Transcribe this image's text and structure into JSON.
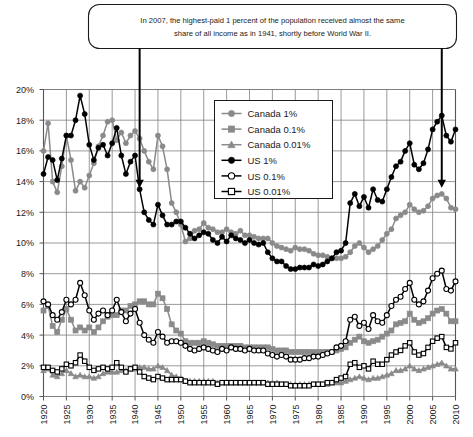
{
  "annotation": {
    "line1": "In 2007, the highest-paid 1 percent of the population received almost the same",
    "line2": "share of all income as in 1941, shortly before World War II.",
    "arrow_left_year": 1941,
    "arrow_right_year": 2007
  },
  "legend": {
    "position": "top-center-inside",
    "items": [
      {
        "label": "Canada 1%",
        "key": "canada_1",
        "color": "#8a8a8a",
        "marker": "circle-filled"
      },
      {
        "label": "Canada 0.1%",
        "key": "canada_01",
        "color": "#8a8a8a",
        "marker": "square-filled"
      },
      {
        "label": "Canada 0.01%",
        "key": "canada_001",
        "color": "#8a8a8a",
        "marker": "triangle-filled"
      },
      {
        "label": "US 1%",
        "key": "us_1",
        "color": "#000000",
        "marker": "circle-filled"
      },
      {
        "label": "US 0.1%",
        "key": "us_01",
        "color": "#000000",
        "marker": "circle-open"
      },
      {
        "label": "US 0.01%",
        "key": "us_001",
        "color": "#000000",
        "marker": "square-open"
      }
    ]
  },
  "chart_data": {
    "type": "line",
    "title": "",
    "xlabel": "",
    "ylabel": "",
    "xlim": [
      1920,
      2010
    ],
    "ylim": [
      0,
      20
    ],
    "ytick_values": [
      0,
      2,
      4,
      6,
      8,
      10,
      12,
      14,
      16,
      18,
      20
    ],
    "ytick_labels": [
      "0%",
      "2%",
      "4%",
      "6%",
      "8%",
      "10%",
      "12%",
      "14%",
      "16%",
      "18%",
      "20%"
    ],
    "xtick_values": [
      1920,
      1925,
      1930,
      1935,
      1940,
      1945,
      1950,
      1955,
      1960,
      1965,
      1970,
      1975,
      1980,
      1985,
      1990,
      1995,
      2000,
      2005,
      2010
    ],
    "xtick_labels": [
      "1920",
      "1925",
      "1930",
      "1935",
      "1940",
      "1945",
      "1950",
      "1955",
      "1960",
      "1965",
      "1970",
      "1975",
      "1980",
      "1985",
      "1990",
      "1995",
      "2000",
      "2005",
      "2010"
    ],
    "grid": true,
    "x": [
      1920,
      1921,
      1922,
      1923,
      1924,
      1925,
      1926,
      1927,
      1928,
      1929,
      1930,
      1931,
      1932,
      1933,
      1934,
      1935,
      1936,
      1937,
      1938,
      1939,
      1940,
      1941,
      1942,
      1943,
      1944,
      1945,
      1946,
      1947,
      1948,
      1949,
      1950,
      1951,
      1952,
      1953,
      1954,
      1955,
      1956,
      1957,
      1958,
      1959,
      1960,
      1961,
      1962,
      1963,
      1964,
      1965,
      1966,
      1967,
      1968,
      1969,
      1970,
      1971,
      1972,
      1973,
      1974,
      1975,
      1976,
      1977,
      1978,
      1979,
      1980,
      1981,
      1982,
      1983,
      1984,
      1985,
      1986,
      1987,
      1988,
      1989,
      1990,
      1991,
      1992,
      1993,
      1994,
      1995,
      1996,
      1997,
      1998,
      1999,
      2000,
      2001,
      2002,
      2003,
      2004,
      2005,
      2006,
      2007,
      2008,
      2009,
      2010
    ],
    "series": [
      {
        "name": "Canada 1%",
        "key": "canada_1",
        "color": "#8a8a8a",
        "marker": "circle-filled",
        "values": [
          16.0,
          17.8,
          14.0,
          13.3,
          15.0,
          17.0,
          15.4,
          13.4,
          14.0,
          13.6,
          14.4,
          15.2,
          16.3,
          17.0,
          17.9,
          18.0,
          16.7,
          17.2,
          16.5,
          17.0,
          17.3,
          16.8,
          16.0,
          15.3,
          14.8,
          17.0,
          16.3,
          14.8,
          12.6,
          12.0,
          11.2,
          10.1,
          10.3,
          10.8,
          10.9,
          11.3,
          11.0,
          10.9,
          10.7,
          10.7,
          10.9,
          10.7,
          10.6,
          10.8,
          10.5,
          10.5,
          10.4,
          10.3,
          10.3,
          10.3,
          10.0,
          9.8,
          9.7,
          9.6,
          9.5,
          9.7,
          9.6,
          9.6,
          9.5,
          9.3,
          9.2,
          9.2,
          9.1,
          9.0,
          9.0,
          9.0,
          9.1,
          9.4,
          9.8,
          10.0,
          9.7,
          9.4,
          9.6,
          9.8,
          10.2,
          10.6,
          10.9,
          11.6,
          11.8,
          12.0,
          12.5,
          12.2,
          12.0,
          12.1,
          12.4,
          12.9,
          13.1,
          13.2,
          12.9,
          12.3,
          12.2
        ]
      },
      {
        "name": "Canada 0.1%",
        "key": "canada_01",
        "color": "#8a8a8a",
        "marker": "square-filled",
        "values": [
          5.6,
          5.9,
          4.6,
          4.2,
          5.0,
          5.7,
          5.0,
          4.3,
          4.5,
          4.3,
          4.5,
          4.2,
          4.5,
          4.9,
          5.2,
          5.3,
          5.3,
          5.6,
          5.6,
          5.9,
          6.0,
          6.2,
          6.2,
          6.0,
          6.0,
          6.7,
          6.4,
          5.7,
          4.7,
          4.3,
          4.1,
          3.6,
          3.5,
          3.5,
          3.5,
          3.6,
          3.5,
          3.4,
          3.3,
          3.3,
          3.3,
          3.3,
          3.3,
          3.3,
          3.2,
          3.2,
          3.2,
          3.2,
          3.2,
          3.2,
          3.1,
          3.0,
          3.0,
          3.0,
          2.9,
          2.9,
          2.9,
          2.9,
          2.9,
          2.9,
          2.9,
          2.9,
          2.9,
          2.9,
          3.0,
          3.1,
          3.2,
          3.5,
          3.7,
          3.9,
          3.6,
          3.5,
          3.6,
          3.7,
          3.9,
          4.1,
          4.3,
          4.7,
          4.8,
          4.9,
          5.4,
          5.0,
          4.8,
          4.9,
          5.1,
          5.4,
          5.6,
          5.7,
          5.4,
          4.9,
          4.9
        ]
      },
      {
        "name": "Canada 0.01%",
        "key": "canada_001",
        "color": "#8a8a8a",
        "marker": "triangle-filled",
        "values": [
          1.7,
          1.8,
          1.4,
          1.3,
          1.5,
          1.7,
          1.5,
          1.3,
          1.4,
          1.3,
          1.3,
          1.2,
          1.3,
          1.5,
          1.6,
          1.6,
          1.6,
          1.7,
          1.7,
          1.8,
          1.8,
          1.9,
          1.9,
          1.8,
          1.8,
          2.0,
          1.9,
          1.7,
          1.4,
          1.3,
          1.2,
          1.0,
          1.0,
          1.0,
          1.0,
          1.0,
          1.0,
          1.0,
          0.9,
          0.9,
          0.9,
          0.9,
          0.9,
          0.9,
          0.9,
          0.9,
          0.9,
          0.9,
          0.9,
          0.9,
          0.9,
          0.9,
          0.8,
          0.8,
          0.8,
          0.8,
          0.8,
          0.8,
          0.8,
          0.8,
          0.8,
          0.8,
          0.8,
          0.9,
          0.9,
          0.9,
          1.0,
          1.1,
          1.2,
          1.3,
          1.2,
          1.1,
          1.2,
          1.2,
          1.3,
          1.4,
          1.5,
          1.7,
          1.7,
          1.8,
          2.0,
          1.8,
          1.7,
          1.8,
          1.9,
          2.0,
          2.1,
          2.2,
          2.0,
          1.8,
          1.8
        ]
      },
      {
        "name": "US 1%",
        "key": "us_1",
        "color": "#000000",
        "marker": "circle-filled",
        "values": [
          14.5,
          15.6,
          15.4,
          14.1,
          15.5,
          17.0,
          17.0,
          18.0,
          19.6,
          18.4,
          16.4,
          15.4,
          16.2,
          16.4,
          15.7,
          16.5,
          17.5,
          15.7,
          14.5,
          15.3,
          15.7,
          13.5,
          12.0,
          11.5,
          11.2,
          12.5,
          11.8,
          11.2,
          11.2,
          11.4,
          11.4,
          11.0,
          10.6,
          10.3,
          10.5,
          10.7,
          10.6,
          10.2,
          10.0,
          10.4,
          10.1,
          10.5,
          10.3,
          10.2,
          10.0,
          10.2,
          10.0,
          9.9,
          10.0,
          9.4,
          9.0,
          8.8,
          8.8,
          8.5,
          8.3,
          8.3,
          8.4,
          8.4,
          8.4,
          8.6,
          8.5,
          8.6,
          8.8,
          9.0,
          9.4,
          9.5,
          10.0,
          12.6,
          13.2,
          12.4,
          13.0,
          12.3,
          13.5,
          12.8,
          12.7,
          13.5,
          14.3,
          15.0,
          15.3,
          16.0,
          16.5,
          15.1,
          14.8,
          15.2,
          16.1,
          17.4,
          17.9,
          18.3,
          17.0,
          16.6,
          17.4
        ]
      },
      {
        "name": "US 0.1%",
        "key": "us_01",
        "color": "#000000",
        "marker": "circle-open",
        "values": [
          6.2,
          6.0,
          5.3,
          5.0,
          5.5,
          6.3,
          6.0,
          6.3,
          7.4,
          6.6,
          5.6,
          5.0,
          5.4,
          5.6,
          5.3,
          5.6,
          6.3,
          5.5,
          4.9,
          5.4,
          5.7,
          4.8,
          4.0,
          3.7,
          3.5,
          4.2,
          3.9,
          3.5,
          3.6,
          3.6,
          3.5,
          3.3,
          3.1,
          3.0,
          3.1,
          3.2,
          3.1,
          3.0,
          2.9,
          3.1,
          3.0,
          3.2,
          3.1,
          3.1,
          3.0,
          3.1,
          3.0,
          3.0,
          3.0,
          2.8,
          2.7,
          2.6,
          2.7,
          2.6,
          2.4,
          2.4,
          2.4,
          2.5,
          2.5,
          2.6,
          2.6,
          2.7,
          2.8,
          2.9,
          3.2,
          3.3,
          3.6,
          5.0,
          5.2,
          4.6,
          4.8,
          4.4,
          5.3,
          4.9,
          4.8,
          5.3,
          5.9,
          6.3,
          6.5,
          7.0,
          7.4,
          6.3,
          6.0,
          6.2,
          6.9,
          7.7,
          8.0,
          8.2,
          7.0,
          6.9,
          7.5
        ]
      },
      {
        "name": "US 0.01%",
        "key": "us_001",
        "color": "#000000",
        "marker": "square-open",
        "values": [
          1.9,
          1.9,
          1.7,
          1.6,
          1.8,
          2.1,
          2.0,
          2.2,
          2.7,
          2.3,
          1.9,
          1.7,
          1.8,
          1.9,
          1.8,
          1.9,
          2.2,
          1.9,
          1.6,
          1.8,
          1.9,
          1.6,
          1.3,
          1.2,
          1.1,
          1.3,
          1.2,
          1.1,
          1.1,
          1.1,
          1.1,
          1.0,
          0.9,
          0.9,
          0.9,
          0.9,
          0.9,
          0.9,
          0.8,
          0.9,
          0.9,
          0.9,
          0.9,
          0.9,
          0.9,
          0.9,
          0.9,
          0.9,
          0.9,
          0.8,
          0.8,
          0.8,
          0.8,
          0.8,
          0.7,
          0.7,
          0.7,
          0.7,
          0.7,
          0.8,
          0.8,
          0.8,
          0.9,
          0.9,
          1.1,
          1.2,
          1.3,
          2.1,
          2.2,
          1.9,
          2.0,
          1.8,
          2.3,
          2.1,
          2.1,
          2.4,
          2.7,
          2.9,
          3.0,
          3.3,
          3.5,
          2.9,
          2.7,
          2.8,
          3.2,
          3.6,
          3.8,
          3.9,
          3.2,
          3.1,
          3.5
        ]
      }
    ]
  }
}
